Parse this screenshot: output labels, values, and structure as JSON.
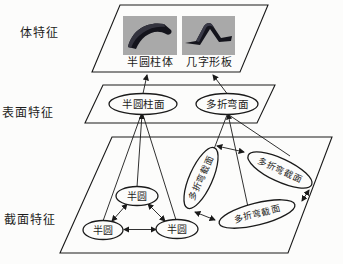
{
  "diagram": {
    "title_implicit": "feature-hierarchy-diagram",
    "side_labels": [
      {
        "label": "体特征"
      },
      {
        "label": "表面特征"
      },
      {
        "label": "截面特征"
      }
    ],
    "body_plane": {
      "thumbnails": [
        {
          "caption": "半圆柱体",
          "icon": "half-cylinder-shell-photo"
        },
        {
          "caption": "几字形板",
          "icon": "bent-plate-photo"
        }
      ]
    },
    "surface_plane": {
      "nodes": [
        {
          "label": "半圆柱面"
        },
        {
          "label": "多折弯面"
        }
      ]
    },
    "section_plane": {
      "semicircle_nodes": [
        {
          "label": "半圆"
        },
        {
          "label": "半圆"
        },
        {
          "label": "半圆"
        }
      ],
      "multibend_nodes": [
        {
          "label": "多折弯截面"
        },
        {
          "label": "多折弯截面"
        },
        {
          "label": "多折弯截面"
        }
      ]
    },
    "colors": {
      "line": "#1a1a1a",
      "background": "#fcfcfb",
      "thumbnail_background": "#a9a9a9",
      "thumbnail_shape": "#14141c"
    }
  }
}
